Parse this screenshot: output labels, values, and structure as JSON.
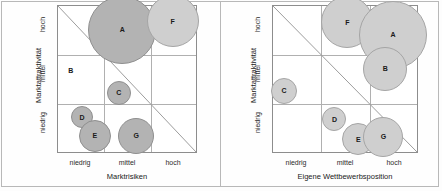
{
  "figure": {
    "panels": [
      {
        "id": "left",
        "xaxis_title": "Marktrisiken",
        "yaxis_title": "Marktattraktivität",
        "xticks": [
          "niedrig",
          "mittel",
          "hoch"
        ],
        "yticks": [
          "hoch",
          "mittel",
          "niedrig"
        ]
      },
      {
        "id": "right",
        "xaxis_title": "Eigene Wettbewerbsposition",
        "yaxis_title": "Marktattraktivität",
        "xticks": [
          "niedrig",
          "mittel",
          "hoch"
        ],
        "yticks": [
          "hoch",
          "mittel",
          "niedrig"
        ]
      }
    ]
  },
  "chart_data": [
    {
      "type": "scatter",
      "title": "",
      "xlabel": "Marktrisiken",
      "ylabel": "Marktattraktivität",
      "xlim": [
        0,
        3
      ],
      "ylim": [
        0,
        3
      ],
      "xticklabels": [
        "niedrig",
        "mittel",
        "hoch"
      ],
      "yticklabels": [
        "niedrig",
        "mittel",
        "hoch"
      ],
      "grid": true,
      "legend": "none",
      "annotations": [
        "diagonal reference line from top-left to bottom-right"
      ],
      "points": [
        {
          "label": "A",
          "x": 1.4,
          "y": 2.51,
          "size": 34,
          "shade": "mid"
        },
        {
          "label": "F",
          "x": 2.49,
          "y": 2.69,
          "size": 26,
          "shade": "light"
        },
        {
          "label": "B",
          "x": 0.28,
          "y": 1.67,
          "size": 0,
          "shade": "none"
        },
        {
          "label": "C",
          "x": 1.32,
          "y": 1.22,
          "size": 12,
          "shade": "mid"
        },
        {
          "label": "D",
          "x": 0.52,
          "y": 0.71,
          "size": 11,
          "shade": "mid"
        },
        {
          "label": "E",
          "x": 0.8,
          "y": 0.33,
          "size": 16,
          "shade": "mid"
        },
        {
          "label": "G",
          "x": 1.7,
          "y": 0.33,
          "size": 18,
          "shade": "mid"
        }
      ]
    },
    {
      "type": "scatter",
      "title": "",
      "xlabel": "Eigene Wettbewerbsposition",
      "ylabel": "Marktattraktivität",
      "xlim": [
        0,
        3
      ],
      "ylim": [
        0,
        3
      ],
      "xticklabels": [
        "niedrig",
        "mittel",
        "hoch"
      ],
      "yticklabels": [
        "niedrig",
        "mittel",
        "hoch"
      ],
      "grid": true,
      "legend": "none",
      "annotations": [
        "diagonal reference line from top-left to bottom-right"
      ],
      "points": [
        {
          "label": "F",
          "x": 1.55,
          "y": 2.67,
          "size": 26,
          "shade": "light"
        },
        {
          "label": "A",
          "x": 2.5,
          "y": 2.41,
          "size": 34,
          "shade": "light"
        },
        {
          "label": "B",
          "x": 2.34,
          "y": 1.71,
          "size": 22,
          "shade": "light"
        },
        {
          "label": "C",
          "x": 0.23,
          "y": 1.26,
          "size": 13,
          "shade": "light"
        },
        {
          "label": "D",
          "x": 1.28,
          "y": 0.67,
          "size": 12,
          "shade": "light"
        },
        {
          "label": "E",
          "x": 1.78,
          "y": 0.26,
          "size": 16,
          "shade": "light"
        },
        {
          "label": "G",
          "x": 2.3,
          "y": 0.31,
          "size": 20,
          "shade": "light"
        }
      ]
    }
  ]
}
